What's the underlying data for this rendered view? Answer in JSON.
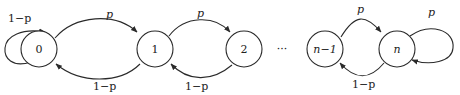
{
  "diagram": {
    "type": "markov-chain",
    "nodes": [
      {
        "id": "0",
        "label": "0"
      },
      {
        "id": "1",
        "label": "1"
      },
      {
        "id": "2",
        "label": "2"
      },
      {
        "id": "n-1",
        "label": "n−1"
      },
      {
        "id": "n",
        "label": "n"
      }
    ],
    "ellipsis": "···",
    "edges": [
      {
        "from": "0",
        "to": "0",
        "label": "1−p"
      },
      {
        "from": "0",
        "to": "1",
        "label": "p"
      },
      {
        "from": "1",
        "to": "0",
        "label": "1−p"
      },
      {
        "from": "1",
        "to": "2",
        "label": "p"
      },
      {
        "from": "2",
        "to": "1",
        "label": "1−p"
      },
      {
        "from": "n-1",
        "to": "n",
        "label": "p"
      },
      {
        "from": "n",
        "to": "n-1",
        "label": "1−p"
      },
      {
        "from": "n",
        "to": "n",
        "label": "p"
      }
    ]
  }
}
